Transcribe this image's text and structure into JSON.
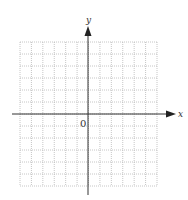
{
  "diagram": {
    "type": "coordinate-grid",
    "x_axis_label": "x",
    "y_axis_label": "y",
    "origin_label": "0",
    "grid": {
      "columns": 12,
      "rows": 12,
      "x_range": [
        -6,
        6
      ],
      "y_range": [
        -6,
        6
      ],
      "line_style": "dotted",
      "line_color": "#b8b8b8"
    },
    "axis_color": "#333333"
  }
}
